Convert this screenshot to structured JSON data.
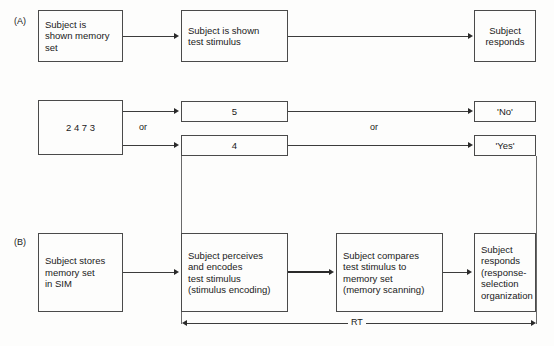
{
  "figure": {
    "panels": [
      {
        "id": "A",
        "label": "(A)"
      },
      {
        "id": "B",
        "label": "(B)"
      }
    ]
  },
  "panel_a": {
    "boxes": [
      {
        "name": "subject-shown-memory-set",
        "text": "Subject is\nshown memory\nset"
      },
      {
        "name": "subject-shown-test-stimulus",
        "text": "Subject is shown\ntest stimulus"
      },
      {
        "name": "subject-responds",
        "text": "Subject\nresponds"
      }
    ]
  },
  "example_row": {
    "memory_set": "2 4 7 3",
    "test_stimuli": [
      "5",
      "4"
    ],
    "responses": [
      "'No'",
      "'Yes'"
    ],
    "connector_labels": [
      "or",
      "or"
    ]
  },
  "panel_b": {
    "boxes": [
      {
        "name": "subject-stores-memory-set",
        "text": "Subject stores\nmemory set\nin SIM"
      },
      {
        "name": "subject-perceives-encodes",
        "text": "Subject perceives\nand encodes\ntest stimulus\n(stimulus encoding)"
      },
      {
        "name": "subject-compares",
        "text": "Subject compares\ntest stimulus to\nmemory set\n(memory scanning)"
      },
      {
        "name": "subject-responds-selection",
        "text": "Subject\nresponds\n(response-\nselection\norganization"
      }
    ],
    "rt_label": "RT"
  },
  "colors": {
    "background": "#fdfdfc",
    "box_border": "#4a4a4a",
    "line": "#3c3c3c",
    "text": "#1a1a1a"
  }
}
